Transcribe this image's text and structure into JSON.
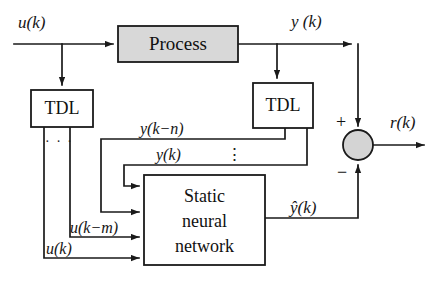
{
  "diagram": {
    "type": "block-diagram",
    "colors": {
      "line": "#1a1a1a",
      "box_fill_shaded": "#d8d8d8",
      "box_fill_plain": "#ffffff",
      "text": "#111111",
      "background": "#ffffff"
    },
    "blocks": [
      {
        "id": "process",
        "label": "Process",
        "fill": "shaded",
        "x": 118,
        "y": 26,
        "w": 120,
        "h": 36
      },
      {
        "id": "tdl_left",
        "label": "TDL",
        "fill": "plain",
        "x": 31,
        "y": 90,
        "w": 62,
        "h": 37
      },
      {
        "id": "tdl_right",
        "label": "TDL",
        "fill": "plain",
        "x": 253,
        "y": 83,
        "w": 60,
        "h": 45
      },
      {
        "id": "nn",
        "label": "Static neural network",
        "label_lines": [
          "Static",
          "neural",
          "network"
        ],
        "fill": "plain",
        "x": 144,
        "y": 175,
        "w": 121,
        "h": 90
      }
    ],
    "summing_junction": {
      "id": "sum",
      "cx": 358,
      "cy": 145,
      "r": 15,
      "fill": "shaded",
      "signs": [
        {
          "symbol": "+",
          "position": "top-left"
        },
        {
          "symbol": "−",
          "position": "bottom-left"
        }
      ]
    },
    "signals": [
      {
        "id": "u_in",
        "label": "u(k)",
        "where": "top-left input"
      },
      {
        "id": "y_out",
        "label": "y (k)",
        "where": "process output"
      },
      {
        "id": "r_out",
        "label": "r(k)",
        "where": "summer output"
      },
      {
        "id": "y_k_n",
        "label": "y(k−n)",
        "where": "tdl-right feedback upper"
      },
      {
        "id": "y_k",
        "label": "y(k)",
        "where": "tdl-right feedback lower"
      },
      {
        "id": "u_k_m",
        "label": "u(k−m)",
        "where": "tdl-left feedback upper"
      },
      {
        "id": "u_k",
        "label": "u(k)",
        "where": "tdl-left feedback lower"
      },
      {
        "id": "y_hat",
        "label": "ŷ(k)",
        "where": "neural network output"
      }
    ],
    "ellipses": [
      {
        "id": "tdl_left_dots",
        "symbol": "· · ·",
        "orientation": "horizontal"
      },
      {
        "id": "tdl_right_dots",
        "symbol": "⋮",
        "orientation": "vertical"
      }
    ]
  }
}
